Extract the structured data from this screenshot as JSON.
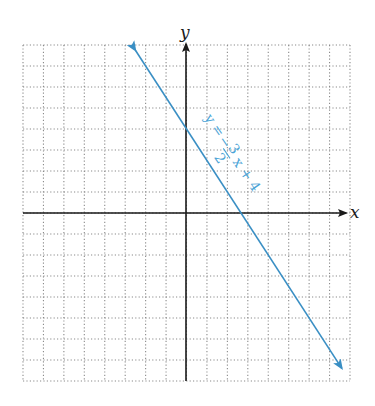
{
  "chart_data": {
    "type": "line",
    "title": "",
    "xlabel": "x",
    "ylabel": "y",
    "xlim": [
      -8,
      8
    ],
    "ylim": [
      -8,
      8
    ],
    "grid": true,
    "grid_style": "dotted",
    "tick_labels": false,
    "series": [
      {
        "name": "y = -3/2 x + 4",
        "equation": "y = -(3/2)x + 4",
        "slope": -1.5,
        "intercept": 4,
        "x": [
          -2.5,
          0,
          2.667,
          7.6
        ],
        "y": [
          7.75,
          4,
          0,
          -7.4
        ],
        "color": "#3a8fc4",
        "arrows": "both"
      }
    ],
    "annotations": [
      {
        "text_parts": [
          "y =",
          "−",
          "3",
          "2",
          "x + 4"
        ],
        "text": "y = −3/2 x + 4",
        "color": "#4aa3d6",
        "placement": "along line, right side"
      }
    ]
  },
  "labels": {
    "x_axis": "x",
    "y_axis": "y",
    "eq_lhs": "y =",
    "eq_minus": "−",
    "eq_num": "3",
    "eq_den": "2",
    "eq_rhs": "x + 4"
  }
}
